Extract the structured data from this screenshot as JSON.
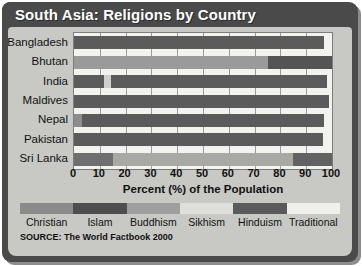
{
  "title": "South Asia: Religions by Country",
  "source": "SOURCE: The World Factbook 2000",
  "axis": {
    "xlabel": "Percent (%) of the Population",
    "ticks": [
      "0",
      "10",
      "20",
      "30",
      "40",
      "50",
      "60",
      "70",
      "80",
      "90",
      "100"
    ]
  },
  "legend": {
    "entries": [
      {
        "label": "Christian",
        "color": "#8a8a8a"
      },
      {
        "label": "Islam",
        "color": "#4e4e4e"
      },
      {
        "label": "Buddhism",
        "color": "#9e9e9e"
      },
      {
        "label": "Sikhism",
        "color": "#dededa"
      },
      {
        "label": "Hinduism",
        "color": "#5b5b5b"
      },
      {
        "label": "Traditional",
        "color": "#efefeb"
      }
    ]
  },
  "colors": {
    "frame": "#4a4a4a",
    "panel": "#c8c8c4",
    "plot_bg": "#f2f2ee",
    "grid": "#9a9a9a",
    "title_text": "#ffffff"
  },
  "chart_data": {
    "type": "bar",
    "orientation": "horizontal",
    "stacked": true,
    "title": "South Asia: Religions by Country",
    "xlabel": "Percent (%) of the Population",
    "ylabel": "",
    "xlim": [
      0,
      100
    ],
    "grid": true,
    "legend_position": "bottom",
    "categories": [
      "Bangladesh",
      "Bhutan",
      "India",
      "Maldives",
      "Nepal",
      "Pakistan",
      "Sri Lanka"
    ],
    "series": [
      {
        "name": "Christian",
        "values": [
          0,
          0,
          0,
          0,
          0,
          0,
          0
        ]
      },
      {
        "name": "Islam",
        "values": [
          88.0,
          0,
          13.0,
          100.0,
          3.0,
          97.0,
          8.0
        ]
      },
      {
        "name": "Buddhism",
        "values": [
          0,
          75.0,
          0,
          0,
          0,
          0,
          70.0
        ]
      },
      {
        "name": "Sikhism",
        "values": [
          0,
          0,
          2.0,
          0,
          0,
          0,
          0
        ]
      },
      {
        "name": "Hinduism",
        "values": [
          10.0,
          25.0,
          82.0,
          0,
          94.0,
          0,
          7.0
        ]
      },
      {
        "name": "Traditional",
        "values": [
          0,
          0,
          0,
          0,
          0,
          0,
          0
        ]
      }
    ],
    "bars": [
      {
        "category": "Bangladesh",
        "segments": [
          {
            "religion": "Islam",
            "start": 0,
            "end": 97.0,
            "color": "#5b5b5b"
          }
        ]
      },
      {
        "category": "Bhutan",
        "segments": [
          {
            "religion": "Buddhism",
            "start": 0,
            "end": 75.0,
            "color": "#9a9a9a"
          },
          {
            "religion": "Hinduism",
            "start": 75.0,
            "end": 100.0,
            "color": "#545454"
          }
        ]
      },
      {
        "category": "India",
        "segments": [
          {
            "religion": "Islam",
            "start": 0,
            "end": 11.5,
            "color": "#5b5b5b"
          },
          {
            "religion": "Sikhism",
            "start": 11.5,
            "end": 14.5,
            "color": "#cfcfcb"
          },
          {
            "religion": "Hinduism",
            "start": 14.5,
            "end": 98.0,
            "color": "#5b5b5b"
          }
        ]
      },
      {
        "category": "Maldives",
        "segments": [
          {
            "religion": "Islam",
            "start": 0,
            "end": 99.0,
            "color": "#5b5b5b"
          }
        ]
      },
      {
        "category": "Nepal",
        "segments": [
          {
            "religion": "Islam",
            "start": 0,
            "end": 3.0,
            "color": "#8d8d8d"
          },
          {
            "religion": "Hinduism",
            "start": 3.0,
            "end": 97.0,
            "color": "#5b5b5b"
          }
        ]
      },
      {
        "category": "Pakistan",
        "segments": [
          {
            "religion": "Islam",
            "start": 0,
            "end": 96.5,
            "color": "#5b5b5b"
          }
        ]
      },
      {
        "category": "Sri Lanka",
        "segments": [
          {
            "religion": "Islam",
            "start": 0,
            "end": 15.0,
            "color": "#6f6f6f"
          },
          {
            "religion": "Buddhism",
            "start": 15.0,
            "end": 85.0,
            "color": "#a8a8a4"
          },
          {
            "religion": "Hinduism",
            "start": 85.0,
            "end": 100.0,
            "color": "#626262"
          }
        ]
      }
    ]
  }
}
